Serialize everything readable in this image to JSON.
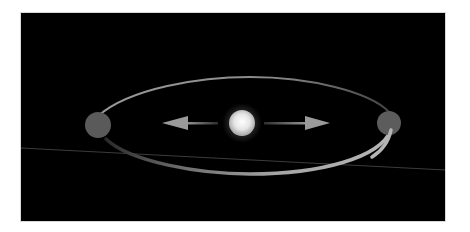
{
  "scene": {
    "description": "Binary orbit diagram: central star with two planets on an elliptical orbit, arrows pointing outward",
    "background_color": "#000000",
    "orbit_color": "#9a9a9a",
    "planet_color": "#5a5a5a",
    "star_color": "#f2f2f2",
    "arrow_color": "#9a9a9a",
    "horizon_color": "#3a3a3a"
  },
  "objects": {
    "star": {
      "label": "star",
      "cx": 242,
      "cy": 123,
      "r": 13
    },
    "planet_left": {
      "label": "planet-left",
      "cx": 98,
      "cy": 125,
      "r": 13
    },
    "planet_right": {
      "label": "planet-right",
      "cx": 389,
      "cy": 123,
      "r": 12
    },
    "arrow_left": {
      "label": "arrow-left",
      "from": [
        218,
        123
      ],
      "to": [
        162,
        123
      ]
    },
    "arrow_right": {
      "label": "arrow-right",
      "from": [
        264,
        123
      ],
      "to": [
        330,
        123
      ]
    }
  }
}
